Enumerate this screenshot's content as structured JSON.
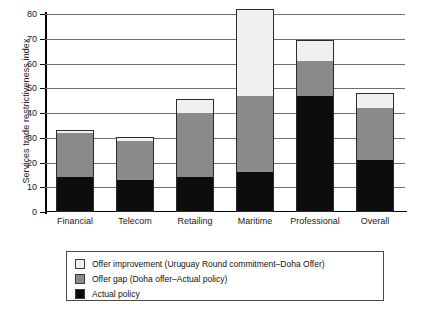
{
  "chart_data": {
    "type": "bar",
    "stacked": true,
    "title": "",
    "xlabel": "",
    "ylabel": "Services trade restrictiveness index",
    "ylim": [
      0,
      80
    ],
    "yticks": [
      0,
      10,
      20,
      30,
      40,
      50,
      60,
      70,
      80
    ],
    "ytick_labels": [
      "0",
      "10",
      "20",
      "30",
      "40",
      "50",
      "60",
      "70",
      "80"
    ],
    "grid": true,
    "legend_position": "below-plot",
    "categories": [
      "Financial",
      "Telecom",
      "Retailing",
      "Maritime",
      "Professional",
      "Overall"
    ],
    "series": [
      {
        "name": "Actual policy",
        "color": "#0d0d0d",
        "values": [
          14,
          13,
          14,
          16,
          47,
          21
        ]
      },
      {
        "name": "Offer gap (Doha offer–Actual policy)",
        "color": "#8a8a8a",
        "values": [
          18,
          15.5,
          26,
          31,
          14,
          21
        ]
      },
      {
        "name": "Offer improvement (Uruguay Round commitment–Doha Offer)",
        "color": "#f0f0f0",
        "values": [
          1,
          2,
          5.5,
          35,
          8.5,
          6
        ]
      }
    ],
    "cumulative_tops": {
      "Financial": [
        14,
        32,
        33
      ],
      "Telecom": [
        13,
        28.5,
        30.5
      ],
      "Retailing": [
        14,
        40,
        45.5
      ],
      "Maritime": [
        16,
        47,
        82
      ],
      "Professional": [
        47,
        61,
        69.5
      ],
      "Overall": [
        21,
        42,
        48
      ]
    }
  },
  "legend": {
    "items": [
      {
        "label": "Offer improvement (Uruguay Round commitment–Doha Offer)",
        "color": "#f0f0f0"
      },
      {
        "label": "Offer gap (Doha offer–Actual policy)",
        "color": "#8a8a8a"
      },
      {
        "label": " Actual policy",
        "color": "#0d0d0d"
      }
    ]
  }
}
